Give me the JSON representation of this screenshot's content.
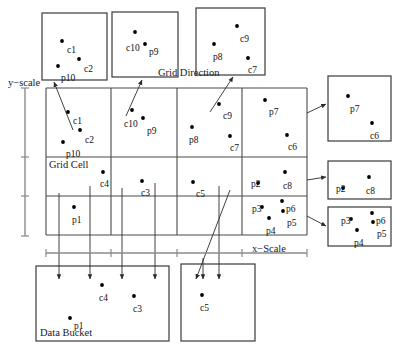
{
  "figure": {
    "title_labels": {
      "grid_direction": "Grid Direction",
      "grid_cell": "Grid Cell",
      "data_bucket": "Data Bucket",
      "y_scale": "y−scale",
      "x_scale": "x−Scale"
    },
    "colors": {
      "stroke": "#3a3a3a",
      "grid_stroke": "#4a4a4a",
      "point": "#000000",
      "scale": "#8a8a8a",
      "text": "#111111",
      "background": "#ffffff"
    }
  },
  "grid": {
    "x0": 46,
    "y0": 88,
    "x1": 307,
    "y1": 235,
    "vlines": [
      46,
      111,
      177,
      242,
      307
    ],
    "hlines": [
      88,
      157,
      196,
      235
    ],
    "cells": [
      {
        "name": "cell-r1c1",
        "points": [
          {
            "id": "c1",
            "x": 68,
            "y": 112,
            "lx": 73,
            "ly": 117
          },
          {
            "id": "c2",
            "x": 80,
            "y": 130,
            "lx": 85,
            "ly": 136
          },
          {
            "id": "p10",
            "x": 63,
            "y": 142,
            "lx": 66,
            "ly": 150
          }
        ]
      },
      {
        "name": "cell-r1c2",
        "points": [
          {
            "id": "c10",
            "x": 132,
            "y": 110,
            "lx": 124,
            "ly": 120
          },
          {
            "id": "p9",
            "x": 143,
            "y": 118,
            "lx": 147,
            "ly": 127
          }
        ]
      },
      {
        "name": "cell-r1c3",
        "points": [
          {
            "id": "c9",
            "x": 219,
            "y": 104,
            "lx": 223,
            "ly": 112
          },
          {
            "id": "p8",
            "x": 192,
            "y": 127,
            "lx": 189,
            "ly": 136
          },
          {
            "id": "c7",
            "x": 230,
            "y": 136,
            "lx": 230,
            "ly": 144
          }
        ]
      },
      {
        "name": "cell-r1c4",
        "points": [
          {
            "id": "p7",
            "x": 265,
            "y": 100,
            "lx": 269,
            "ly": 108
          },
          {
            "id": "c6",
            "x": 287,
            "y": 135,
            "lx": 288,
            "ly": 143
          }
        ]
      },
      {
        "name": "cell-r2c1",
        "points": [
          {
            "id": "c4",
            "x": 103,
            "y": 172,
            "lx": 100,
            "ly": 180
          }
        ]
      },
      {
        "name": "cell-r2c2",
        "points": [
          {
            "id": "c3",
            "x": 142,
            "y": 181,
            "lx": 141,
            "ly": 189
          }
        ]
      },
      {
        "name": "cell-r2c3",
        "points": [
          {
            "id": "c5",
            "x": 193,
            "y": 182,
            "lx": 196,
            "ly": 190
          }
        ]
      },
      {
        "name": "cell-r2c4",
        "points": [
          {
            "id": "p2",
            "x": 258,
            "y": 183,
            "lx": 251,
            "ly": 180
          },
          {
            "id": "c8",
            "x": 285,
            "y": 172,
            "lx": 283,
            "ly": 182
          }
        ]
      },
      {
        "name": "cell-r3c1",
        "points": [
          {
            "id": "p1",
            "x": 74,
            "y": 207,
            "lx": 72,
            "ly": 216
          }
        ]
      },
      {
        "name": "cell-r3c4",
        "points": [
          {
            "id": "p3",
            "x": 262,
            "y": 207,
            "lx": 252,
            "ly": 205
          },
          {
            "id": "p6",
            "x": 282,
            "y": 201,
            "lx": 286,
            "ly": 205
          },
          {
            "id": "p5",
            "x": 283,
            "y": 211,
            "lx": 287,
            "ly": 219
          },
          {
            "id": "p4",
            "x": 269,
            "y": 218,
            "lx": 266,
            "ly": 227
          }
        ]
      }
    ]
  },
  "detached_boxes": [
    {
      "name": "box-cell-r1c1",
      "x": 42,
      "y": 13,
      "w": 65,
      "h": 67,
      "points": [
        {
          "id": "c1",
          "x": 62,
          "y": 41,
          "lx": 67,
          "ly": 46
        },
        {
          "id": "c2",
          "x": 79,
          "y": 59,
          "lx": 84,
          "ly": 65
        },
        {
          "id": "p10",
          "x": 58,
          "y": 66,
          "lx": 61,
          "ly": 74
        }
      ]
    },
    {
      "name": "box-cell-r1c2",
      "x": 112,
      "y": 12,
      "w": 66,
      "h": 65,
      "points": [
        {
          "id": "c10",
          "x": 135,
          "y": 32,
          "lx": 126,
          "ly": 44
        },
        {
          "id": "p9",
          "x": 145,
          "y": 44,
          "lx": 149,
          "ly": 48
        }
      ]
    },
    {
      "name": "box-cell-r1c3",
      "x": 196,
      "y": 8,
      "w": 69,
      "h": 67,
      "points": [
        {
          "id": "c9",
          "x": 237,
          "y": 26,
          "lx": 240,
          "ly": 35
        },
        {
          "id": "p8",
          "x": 214,
          "y": 44,
          "lx": 213,
          "ly": 53
        },
        {
          "id": "c7",
          "x": 248,
          "y": 58,
          "lx": 248,
          "ly": 66
        }
      ]
    },
    {
      "name": "box-cell-r1c4",
      "x": 328,
      "y": 76,
      "w": 63,
      "h": 65,
      "points": [
        {
          "id": "p7",
          "x": 348,
          "y": 96,
          "lx": 350,
          "ly": 105
        },
        {
          "id": "c6",
          "x": 372,
          "y": 123,
          "lx": 370,
          "ly": 132
        }
      ]
    },
    {
      "name": "box-cell-r2c4",
      "x": 328,
      "y": 161,
      "w": 63,
      "h": 38,
      "points": [
        {
          "id": "p2",
          "x": 343,
          "y": 188,
          "lx": 336,
          "ly": 185
        },
        {
          "id": "c8",
          "x": 369,
          "y": 177,
          "lx": 366,
          "ly": 187
        }
      ]
    },
    {
      "name": "box-cell-r3c4",
      "x": 328,
      "y": 207,
      "w": 63,
      "h": 39,
      "points": [
        {
          "id": "p3",
          "x": 351,
          "y": 219,
          "lx": 341,
          "ly": 217
        },
        {
          "id": "p6",
          "x": 372,
          "y": 213,
          "lx": 376,
          "ly": 217
        },
        {
          "id": "p5",
          "x": 373,
          "y": 222,
          "lx": 377,
          "ly": 230
        },
        {
          "id": "p4",
          "x": 357,
          "y": 230,
          "lx": 354,
          "ly": 239
        }
      ]
    },
    {
      "name": "box-data-bucket-1",
      "x": 36,
      "y": 266,
      "w": 133,
      "h": 75,
      "points": [
        {
          "id": "c4",
          "x": 102,
          "y": 285,
          "lx": 99,
          "ly": 294
        },
        {
          "id": "c3",
          "x": 134,
          "y": 296,
          "lx": 133,
          "ly": 305
        },
        {
          "id": "p1",
          "x": 70,
          "y": 318,
          "lx": 74,
          "ly": 322
        }
      ]
    },
    {
      "name": "box-data-bucket-2",
      "x": 181,
      "y": 264,
      "w": 74,
      "h": 77,
      "points": [
        {
          "id": "c5",
          "x": 202,
          "y": 295,
          "lx": 200,
          "ly": 304
        }
      ]
    }
  ],
  "connectors": [
    {
      "name": "leader-cell-r1c1",
      "x1": 73,
      "y1": 130,
      "x2": 54,
      "y2": 82
    },
    {
      "name": "leader-cell-r1c2",
      "x1": 126,
      "y1": 116,
      "x2": 142,
      "y2": 80
    },
    {
      "name": "leader-cell-r1c3",
      "x1": 210,
      "y1": 112,
      "x2": 233,
      "y2": 77
    },
    {
      "name": "leader-cell-r1c4",
      "x1": 307,
      "y1": 113,
      "x2": 326,
      "y2": 104
    },
    {
      "name": "leader-cell-r2c4",
      "x1": 307,
      "y1": 180,
      "x2": 326,
      "y2": 177
    },
    {
      "name": "leader-cell-r3c4",
      "x1": 307,
      "y1": 216,
      "x2": 326,
      "y2": 226
    }
  ],
  "drop_arrows": [
    {
      "name": "drop-arrow-1",
      "x1": 59,
      "y1": 193,
      "x2": 59,
      "y2": 279
    },
    {
      "name": "drop-arrow-2",
      "x1": 90,
      "y1": 186,
      "x2": 90,
      "y2": 279
    },
    {
      "name": "drop-arrow-3",
      "x1": 122,
      "y1": 188,
      "x2": 122,
      "y2": 279
    },
    {
      "name": "drop-arrow-4",
      "x1": 155,
      "y1": 183,
      "x2": 155,
      "y2": 279
    },
    {
      "name": "drop-arrow-5",
      "x1": 203,
      "y1": 258,
      "x2": 203,
      "y2": 279
    },
    {
      "name": "drop-arrow-6",
      "x1": 219,
      "y1": 186,
      "x2": 219,
      "y2": 279
    },
    {
      "name": "drop-arrow-diag",
      "x1": 230,
      "y1": 190,
      "x2": 196,
      "y2": 279
    }
  ],
  "y_scale": {
    "x": 25,
    "y_top": 88,
    "y_bottom": 236,
    "ticks": [
      88,
      157,
      196,
      236
    ],
    "label": "y−scale",
    "label_x": 8,
    "label_y": 78
  },
  "x_scale": {
    "y": 253,
    "x_left": 46,
    "x_right": 307,
    "ticks": [
      46,
      111,
      177,
      242,
      307
    ],
    "label": "x−Scale",
    "label_x": 252,
    "label_y": 244
  },
  "annotations": {
    "grid_direction": {
      "text": "Grid Direction",
      "x": 158,
      "y": 68
    },
    "grid_cell": {
      "text": "Grid Cell",
      "x": 49,
      "y": 160
    },
    "data_bucket": {
      "text": "Data Bucket",
      "x": 40,
      "y": 328
    }
  }
}
